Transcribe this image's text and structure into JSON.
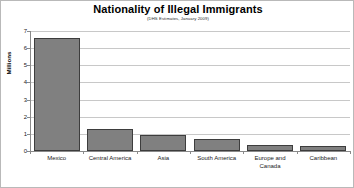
{
  "chart_data": {
    "type": "bar",
    "title": "Nationality of Illegal Immigrants",
    "subtitle": "(DHS Estimates, January 2009)",
    "xlabel": "",
    "ylabel": "Millions",
    "ylim": [
      0,
      7
    ],
    "ytick_labels": [
      "0",
      "1",
      "2",
      "3",
      "4",
      "5",
      "6",
      "7"
    ],
    "ytick_values": [
      0,
      1,
      2,
      3,
      4,
      5,
      6,
      7
    ],
    "grid": true,
    "legend": false,
    "categories": [
      "Mexico",
      "Central America",
      "Asia",
      "South America",
      "Europe and\nCanada",
      "Caribbean"
    ],
    "values": [
      6.6,
      1.3,
      0.95,
      0.7,
      0.35,
      0.3
    ],
    "bar_color": "#808080",
    "bar_edge_color": "#3d3d3d",
    "gridline_color": "#c8c8c8",
    "axis_color": "#8a8a8a",
    "frame_color": "#b9b9b9"
  }
}
